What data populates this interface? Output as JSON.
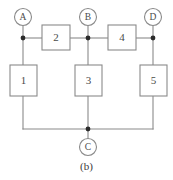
{
  "figure": {
    "caption": "(b)",
    "kind": "network-graph-diagram",
    "colors": {
      "line": "#8a8a8a",
      "node_dot": "#2b2b2b",
      "text": "#4a4a4a",
      "background": "#ffffff"
    },
    "terminals": [
      {
        "id": "A",
        "label": "A",
        "cx": 23,
        "cy": 17,
        "r": 8.5
      },
      {
        "id": "B",
        "label": "B",
        "cx": 88,
        "cy": 17,
        "r": 8.5
      },
      {
        "id": "D",
        "label": "D",
        "cx": 153,
        "cy": 17,
        "r": 8.5
      },
      {
        "id": "C",
        "label": "C",
        "cx": 88,
        "cy": 147,
        "r": 8.5
      }
    ],
    "branch_boxes": [
      {
        "id": "box-1",
        "label": "1",
        "orientation": "vertical",
        "x": 10,
        "y": 65,
        "w": 27,
        "h": 31
      },
      {
        "id": "box-2",
        "label": "2",
        "orientation": "horizontal",
        "x": 42,
        "y": 25,
        "w": 28,
        "h": 25
      },
      {
        "id": "box-3",
        "label": "3",
        "orientation": "vertical",
        "x": 75,
        "y": 65,
        "w": 27,
        "h": 31
      },
      {
        "id": "box-4",
        "label": "4",
        "orientation": "horizontal",
        "x": 108,
        "y": 25,
        "w": 28,
        "h": 25
      },
      {
        "id": "box-5",
        "label": "5",
        "orientation": "vertical",
        "x": 140,
        "y": 65,
        "w": 27,
        "h": 31
      }
    ],
    "junction_dots": [
      {
        "id": "node-a",
        "cx": 23,
        "cy": 38,
        "r": 2.4
      },
      {
        "id": "node-b",
        "cx": 88,
        "cy": 38,
        "r": 2.4
      },
      {
        "id": "node-d",
        "cx": 153,
        "cy": 38,
        "r": 2.4
      },
      {
        "id": "node-c",
        "cx": 88,
        "cy": 129,
        "r": 2.4
      }
    ],
    "wires": [
      {
        "id": "wire-terminal-a-drop",
        "d": "M 23 25.5 L 23 38"
      },
      {
        "id": "wire-terminal-b-drop",
        "d": "M 88 25.5 L 88 38"
      },
      {
        "id": "wire-terminal-d-drop",
        "d": "M 153 25.5 L 153 38"
      },
      {
        "id": "wire-terminal-c-rise",
        "d": "M 88 138.5 L 88 129"
      },
      {
        "id": "wire-a-to-box2",
        "d": "M 23 38 L 42 38"
      },
      {
        "id": "wire-box2-to-b",
        "d": "M 70 38 L 88 38"
      },
      {
        "id": "wire-b-to-box4",
        "d": "M 88 38 L 108 38"
      },
      {
        "id": "wire-box4-to-d",
        "d": "M 136 38 L 153 38"
      },
      {
        "id": "wire-a-to-box1",
        "d": "M 23 38 L 23 65"
      },
      {
        "id": "wire-box1-to-bottom",
        "d": "M 23 96 L 23 129"
      },
      {
        "id": "wire-b-to-box3",
        "d": "M 88 38 L 88 65"
      },
      {
        "id": "wire-box3-to-bottom",
        "d": "M 88 96 L 88 129"
      },
      {
        "id": "wire-d-to-box5",
        "d": "M 153 38 L 153 65"
      },
      {
        "id": "wire-box5-to-bottom",
        "d": "M 153 96 L 153 129"
      },
      {
        "id": "wire-bottom-left-rail",
        "d": "M 23 129 L 88 129"
      },
      {
        "id": "wire-bottom-right-rail",
        "d": "M 88 129 L 153 129"
      }
    ]
  }
}
